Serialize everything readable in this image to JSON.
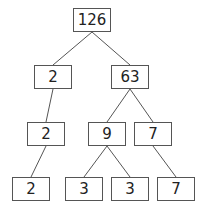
{
  "nodes": [
    {
      "id": "n126",
      "label": "126",
      "x": 73,
      "y": 8,
      "w": 38,
      "h": 24
    },
    {
      "id": "n2a",
      "label": "2",
      "x": 34,
      "y": 65,
      "w": 38,
      "h": 24
    },
    {
      "id": "n63",
      "label": "63",
      "x": 111,
      "y": 65,
      "w": 38,
      "h": 24
    },
    {
      "id": "n2b",
      "label": "2",
      "x": 27,
      "y": 122,
      "w": 38,
      "h": 24
    },
    {
      "id": "n9",
      "label": "9",
      "x": 88,
      "y": 122,
      "w": 38,
      "h": 24
    },
    {
      "id": "n7a",
      "label": "7",
      "x": 134,
      "y": 122,
      "w": 38,
      "h": 24
    },
    {
      "id": "n2c",
      "label": "2",
      "x": 12,
      "y": 177,
      "w": 38,
      "h": 24
    },
    {
      "id": "n3a",
      "label": "3",
      "x": 65,
      "y": 177,
      "w": 38,
      "h": 24
    },
    {
      "id": "n3b",
      "label": "3",
      "x": 111,
      "y": 177,
      "w": 38,
      "h": 24
    },
    {
      "id": "n7b",
      "label": "7",
      "x": 157,
      "y": 177,
      "w": 38,
      "h": 24
    }
  ],
  "edges": [
    [
      "n126",
      "n2a"
    ],
    [
      "n126",
      "n63"
    ],
    [
      "n2a",
      "n2b"
    ],
    [
      "n63",
      "n9"
    ],
    [
      "n63",
      "n7a"
    ],
    [
      "n2b",
      "n2c"
    ],
    [
      "n9",
      "n3a"
    ],
    [
      "n9",
      "n3b"
    ],
    [
      "n7a",
      "n7b"
    ]
  ],
  "colors": {
    "stroke": "#555555",
    "text": "#222222",
    "background": "#ffffff"
  }
}
